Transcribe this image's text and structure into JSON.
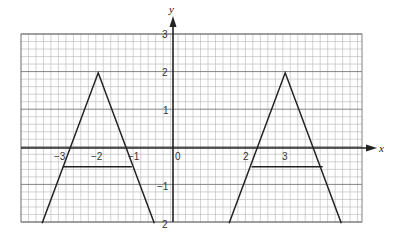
{
  "chart_data": {
    "type": "line",
    "title": "",
    "xlabel": "x",
    "ylabel": "y",
    "xlim": [
      -4.1,
      5.0
    ],
    "ylim": [
      -2,
      3
    ],
    "grid": true,
    "grid_minor_per_unit": 5,
    "x_tick_labels": [
      "−3",
      "−2",
      "−1",
      "0",
      "1",
      "2",
      "3"
    ],
    "y_tick_labels": [
      "3",
      "2",
      "1",
      "−1",
      "2"
    ],
    "series": [
      {
        "name": "left-triangle",
        "points": [
          [
            -3.5,
            -2
          ],
          [
            -2,
            2
          ],
          [
            -0.5,
            -2
          ]
        ]
      },
      {
        "name": "left-segment",
        "points": [
          [
            -2.95,
            -0.5
          ],
          [
            -1.1,
            -0.5
          ]
        ]
      },
      {
        "name": "right-triangle",
        "points": [
          [
            1.5,
            -2
          ],
          [
            3,
            2
          ],
          [
            4.5,
            -2
          ]
        ]
      },
      {
        "name": "right-segment",
        "points": [
          [
            2.1,
            -0.5
          ],
          [
            4.0,
            -0.5
          ]
        ]
      }
    ]
  },
  "labels": {
    "x_axis": "x",
    "y_axis": "y",
    "origin": "0",
    "xm3": "−3",
    "xm2": "−2",
    "xm1": "−1",
    "x1": "1",
    "x2": "2",
    "x3": "3",
    "y3": "3",
    "y2": "2",
    "y1": "1",
    "ym1": "−1",
    "ym2": "2"
  }
}
